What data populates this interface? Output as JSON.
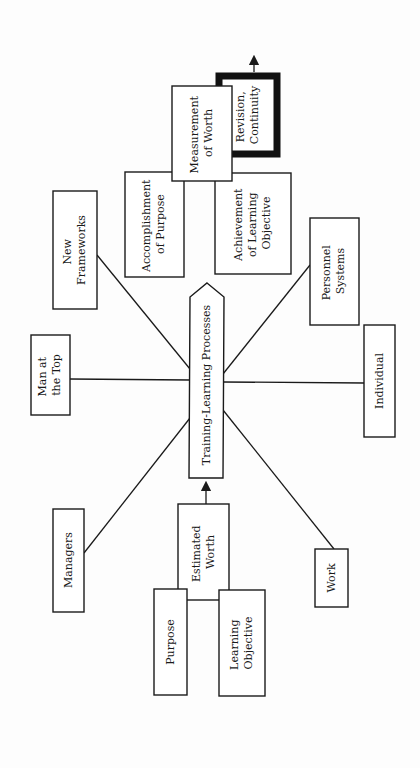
{
  "diagram": {
    "center": {
      "label": "Training-Learning Processes"
    },
    "spokes": [
      {
        "id": "new-frameworks",
        "lines": [
          "New",
          "Frameworks"
        ]
      },
      {
        "id": "man-at-top",
        "lines": [
          "Man at",
          "the Top"
        ]
      },
      {
        "id": "managers",
        "lines": [
          "Managers"
        ]
      },
      {
        "id": "personnel-systems",
        "lines": [
          "Personnel",
          "Systems"
        ]
      },
      {
        "id": "individual",
        "lines": [
          "Individual"
        ]
      },
      {
        "id": "work",
        "lines": [
          "Work"
        ]
      }
    ],
    "estimated_worth": {
      "lines": [
        "Estimated",
        "Worth"
      ]
    },
    "purpose": {
      "lines": [
        "Purpose"
      ]
    },
    "learning_objective": {
      "lines": [
        "Learning",
        "Objective"
      ]
    },
    "measurement_of_worth": {
      "lines": [
        "Measurement",
        "of Worth"
      ]
    },
    "accomplishment_of_purpose": {
      "lines": [
        "Accomplishment",
        "of Purpose"
      ]
    },
    "achievement_of_learning_objective": {
      "lines": [
        "Achievement",
        "of Learning",
        "Objective"
      ]
    },
    "revision_continuity": {
      "lines": [
        "Revision,",
        "Continuity"
      ]
    }
  }
}
